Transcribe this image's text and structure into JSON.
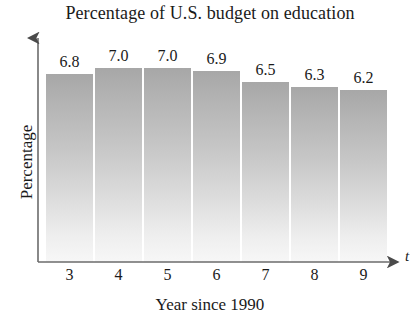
{
  "chart_data": {
    "type": "bar",
    "title": "Percentage of U.S. budget on education",
    "xlabel": "Year since 1990",
    "ylabel": "Percentage",
    "axis_variable": "t",
    "categories": [
      "3",
      "4",
      "5",
      "6",
      "7",
      "8",
      "9"
    ],
    "values": [
      6.8,
      7.0,
      7.0,
      6.9,
      6.5,
      6.3,
      6.2
    ],
    "value_labels": [
      "6.8",
      "7.0",
      "7.0",
      "6.9",
      "6.5",
      "6.3",
      "6.2"
    ],
    "ylim": [
      0,
      7.6
    ],
    "grid": false,
    "legend": false,
    "bar_color_top": "#a7a7a7",
    "bar_color_bottom": "#f7f7f7",
    "axis_color": "#555555",
    "text_color": "#1a1a1a"
  }
}
